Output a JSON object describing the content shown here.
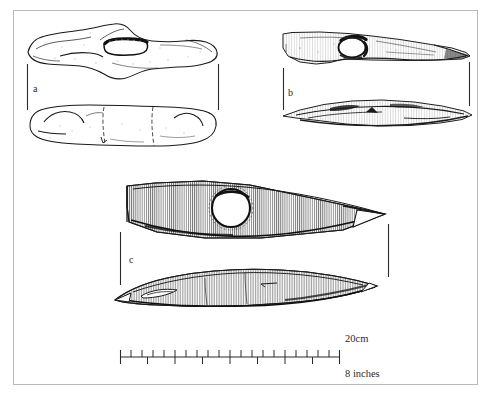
{
  "figure": {
    "background_color": "#ffffff",
    "frame_color": "#b9b9b9",
    "ink_color": "#1a1a1a",
    "hatch_color": "#3a3a3a"
  },
  "specimens": [
    {
      "id": "a",
      "label": "a",
      "description": "double-ended stone implement with central oval shaft hole",
      "views": [
        "plan view",
        "side profile view"
      ]
    },
    {
      "id": "b",
      "label": "b",
      "description": "tapered blade implement with circular shaft hole",
      "views": [
        "plan view",
        "side profile view"
      ]
    },
    {
      "id": "c",
      "label": "c",
      "description": "lozenge-shaped axe head with circular shaft hole and hatched surface",
      "views": [
        "plan view",
        "side profile view"
      ]
    }
  ],
  "scale_bar": {
    "metric_label": "20cm",
    "imperial_label": "8 inches",
    "metric_divisions": 20,
    "imperial_divisions": 8,
    "bar_start_x": 120,
    "bar_end_x": 340
  },
  "page_bleed_text": ""
}
